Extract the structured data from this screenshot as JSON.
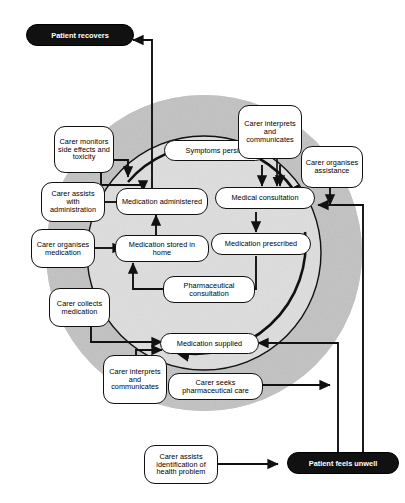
{
  "diagram": {
    "colors": {
      "outer_ring": "#8f8f8f",
      "inner_circle": "#c9c9c9",
      "node_fill": "#ffffff",
      "node_stroke": "#111111",
      "pill_fill": "#111111",
      "pill_text": "#ffffff",
      "background": "#ffffff"
    },
    "outcomes": [
      {
        "id": "patient-recovers",
        "label": "Patient recovers"
      },
      {
        "id": "patient-unwell",
        "label": "Patient feels unwell"
      }
    ],
    "inner_nodes": [
      {
        "id": "symptoms-persist",
        "label": "Symptoms persist"
      },
      {
        "id": "medication-administered",
        "label": "Medication administered"
      },
      {
        "id": "medical-consultation",
        "label": "Medical consultation"
      },
      {
        "id": "medication-stored",
        "label": "Medication stored in home"
      },
      {
        "id": "medication-prescribed",
        "label": "Medication prescribed"
      },
      {
        "id": "pharmaceutical-consultation",
        "label": "Pharmaceutical consultation"
      },
      {
        "id": "medication-supplied",
        "label": "Medication supplied"
      }
    ],
    "carer_nodes": [
      {
        "id": "carer-monitors",
        "label": "Carer monitors side effects and toxicity"
      },
      {
        "id": "carer-assists-admin",
        "label": "Carer assists with administration"
      },
      {
        "id": "carer-organises-medication",
        "label": "Carer organises medication"
      },
      {
        "id": "carer-collects",
        "label": "Carer collects medication"
      },
      {
        "id": "carer-interprets-left",
        "label": "Carer interprets and communicates"
      },
      {
        "id": "carer-interprets-top",
        "label": "Carer interprets and communicates"
      },
      {
        "id": "carer-organises-assistance",
        "label": "Carer organises assistance"
      },
      {
        "id": "carer-seeks-pharma",
        "label": "Carer seeks pharmaceutical care"
      },
      {
        "id": "carer-assists-identification",
        "label": "Carer assists identification of health problem"
      }
    ]
  }
}
